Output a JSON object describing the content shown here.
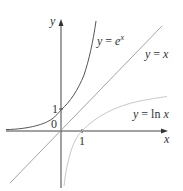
{
  "diagram": {
    "axes": {
      "x_label": "x",
      "y_label": "y",
      "origin_label": "0",
      "x_tick_label": "1",
      "y_tick_label": "1"
    },
    "curves": [
      {
        "name": "exp",
        "label_prefix": "y = ",
        "label_base": "e",
        "label_sup": "x",
        "color": "#555555"
      },
      {
        "name": "identity",
        "label": "y = x",
        "color": "#9a9a9a"
      },
      {
        "name": "log",
        "label": "y = ln x",
        "color": "#c8c8c8"
      }
    ]
  }
}
